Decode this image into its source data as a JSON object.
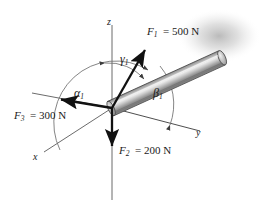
{
  "figure": {
    "type": "force-vector-diagram",
    "background_color": "#ffffff"
  },
  "axes": {
    "x_label": "x",
    "y_label": "y",
    "z_label": "z",
    "axis_color": "#4a4a4a",
    "origin": {
      "x": 112,
      "y": 108
    }
  },
  "forces": [
    {
      "id": "F1",
      "symbol": "F",
      "subscript": "1",
      "magnitude": "500",
      "unit": "N",
      "label": "F1 = 500 N",
      "color": "#111111",
      "direction": "up-right, along rod axis"
    },
    {
      "id": "F2",
      "symbol": "F",
      "subscript": "2",
      "magnitude": "200",
      "unit": "N",
      "label": "F2 = 200 N",
      "color": "#111111",
      "direction": "down, negative z"
    },
    {
      "id": "F3",
      "symbol": "F",
      "subscript": "3",
      "magnitude": "300",
      "unit": "N",
      "label": "F3 = 300 N",
      "color": "#111111",
      "direction": "left, negative y"
    }
  ],
  "angles": [
    {
      "id": "alpha1",
      "glyph": "α",
      "subscript": "1",
      "measured_from": "x-axis"
    },
    {
      "id": "beta1",
      "glyph": "β",
      "subscript": "1",
      "measured_from": "y-axis"
    },
    {
      "id": "gamma1",
      "glyph": "γ",
      "subscript": "1",
      "measured_from": "z-axis"
    }
  ],
  "rod": {
    "name": "cylindrical-rod",
    "fill_light": "#e8e8e8",
    "fill_mid": "#a8a8a8",
    "fill_dark": "#6e6e6e",
    "outline_color": "#3a3a3a",
    "shadow_color": "#b9b9b9"
  }
}
